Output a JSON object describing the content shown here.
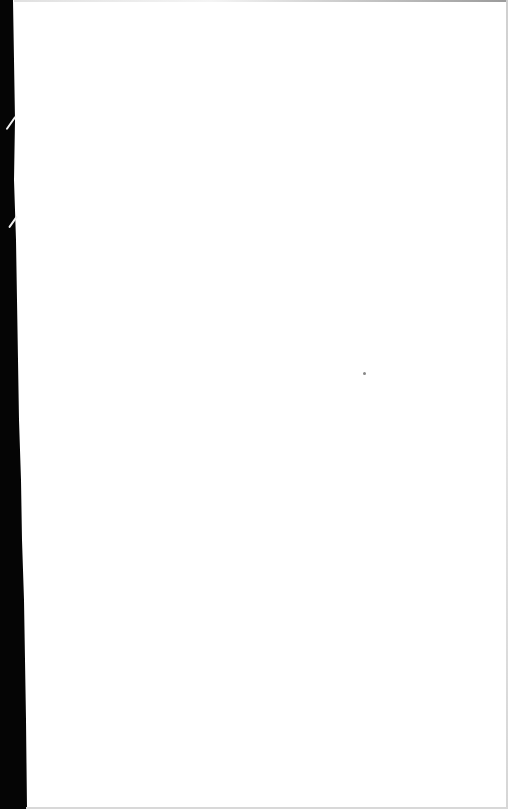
{
  "page": {
    "type": "blank-scanned-page",
    "content_text": "",
    "colors": {
      "paper": "#ffffff",
      "binding_edge": "#050505",
      "border": "#d6d6d6"
    },
    "marks": [
      {
        "name": "speck",
        "x": 364,
        "y": 373
      }
    ]
  }
}
